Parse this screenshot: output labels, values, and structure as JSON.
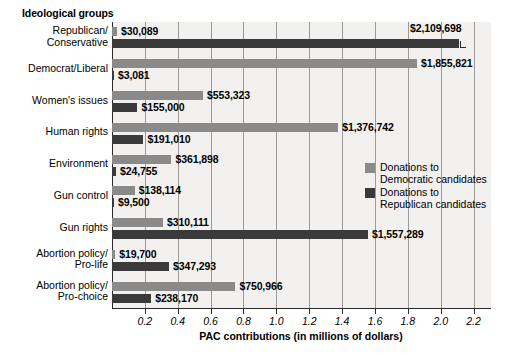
{
  "chart_data": {
    "type": "bar",
    "orientation": "horizontal",
    "title": "",
    "ylabel": "Ideological groups",
    "xlabel": "PAC contributions (in millions of dollars)",
    "xlim": [
      0,
      2.3
    ],
    "xticks": [
      0.2,
      0.4,
      0.6,
      0.8,
      1.0,
      1.2,
      1.4,
      1.6,
      1.8,
      2.0,
      2.2
    ],
    "xticklabels": [
      "0.2",
      "0.4",
      "0.6",
      "0.8",
      "1.0",
      "1.2",
      "1.4",
      "1.6",
      "1.8",
      "2.0",
      "2.2"
    ],
    "grid": "vertical",
    "legend_position": "inside-right",
    "categories": [
      "Republican/\nConservative",
      "Democrat/Liberal",
      "Women's issues",
      "Human rights",
      "Environment",
      "Gun control",
      "Gun rights",
      "Abortion policy/\nPro-life",
      "Abortion policy/\nPro-choice"
    ],
    "series": [
      {
        "name": "Donations to Democratic candidates",
        "color": "#8a8a8a",
        "values": [
          30089,
          1855821,
          553323,
          1376742,
          361898,
          138114,
          310111,
          19700,
          750966
        ],
        "labels": [
          "$30,089",
          "$1,855,821",
          "$553,323",
          "$1,376,742",
          "$361,898",
          "$138,114",
          "$310,111",
          "$19,700",
          "$750,966"
        ]
      },
      {
        "name": "Donations to Republican candidates",
        "color": "#3a3a3a",
        "values": [
          2109698,
          3081,
          155000,
          191010,
          24755,
          9500,
          1557289,
          347293,
          238170
        ],
        "labels": [
          "$2,109,698",
          "$3,081",
          "$155,000",
          "$191,010",
          "$24,755",
          "$9,500",
          "$1,557,289",
          "$347,293",
          "$238,170"
        ]
      }
    ]
  },
  "axis": {
    "y_title": "Ideological groups",
    "x_title": "PAC contributions (in millions of dollars)",
    "ticks": [
      "0.2",
      "0.4",
      "0.6",
      "0.8",
      "1.0",
      "1.2",
      "1.4",
      "1.6",
      "1.8",
      "2.0",
      "2.2"
    ]
  },
  "categories": [
    {
      "line1": "Republican/",
      "line2": "Conservative"
    },
    {
      "line1": "Democrat/Liberal",
      "line2": ""
    },
    {
      "line1": "Women's issues",
      "line2": ""
    },
    {
      "line1": "Human rights",
      "line2": ""
    },
    {
      "line1": "Environment",
      "line2": ""
    },
    {
      "line1": "Gun control",
      "line2": ""
    },
    {
      "line1": "Gun rights",
      "line2": ""
    },
    {
      "line1": "Abortion policy/",
      "line2": "Pro-life"
    },
    {
      "line1": "Abortion policy/",
      "line2": "Pro-choice"
    }
  ],
  "bar_labels": {
    "dem": [
      "$30,089",
      "$1,855,821",
      "$553,323",
      "$1,376,742",
      "$361,898",
      "$138,114",
      "$310,111",
      "$19,700",
      "$750,966"
    ],
    "rep": [
      "$2,109,698",
      "$3,081",
      "$155,000",
      "$191,010",
      "$24,755",
      "$9,500",
      "$1,557,289",
      "$347,293",
      "$238,170"
    ]
  },
  "legend": {
    "items": [
      {
        "swatch": "dem",
        "line1": "Donations to",
        "line2": "Democratic candidates"
      },
      {
        "swatch": "rep",
        "line1": "Donations to",
        "line2": "Republican candidates"
      }
    ]
  },
  "colors": {
    "democratic": "#8a8a8a",
    "republican": "#3a3a3a",
    "plot_background": "#f2f1ef",
    "gridline": "#9b9a98",
    "axis": "#2b2b2b"
  }
}
